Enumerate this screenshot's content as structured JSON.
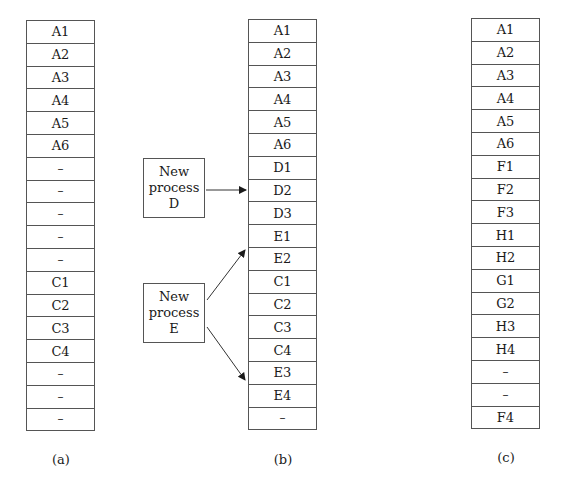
{
  "columns": [
    {
      "caption": "(a)",
      "cells": [
        "A1",
        "A2",
        "A3",
        "A4",
        "A5",
        "A6",
        "–",
        "–",
        "–",
        "–",
        "–",
        "C1",
        "C2",
        "C3",
        "C4",
        "–",
        "–",
        "–"
      ]
    },
    {
      "caption": "(b)",
      "cells": [
        "A1",
        "A2",
        "A3",
        "A4",
        "A5",
        "A6",
        "D1",
        "D2",
        "D3",
        "E1",
        "E2",
        "C1",
        "C2",
        "C3",
        "C4",
        "E3",
        "E4",
        "–"
      ]
    },
    {
      "caption": "(c)",
      "cells": [
        "A1",
        "A2",
        "A3",
        "A4",
        "A5",
        "A6",
        "F1",
        "F2",
        "F3",
        "H1",
        "H2",
        "G1",
        "G2",
        "H3",
        "H4",
        "–",
        "–",
        "F4"
      ]
    }
  ],
  "processes": [
    {
      "line1": "New",
      "line2": "process",
      "line3": "D"
    },
    {
      "line1": "New",
      "line2": "process",
      "line3": "E"
    }
  ],
  "colors": {
    "line": "#555555",
    "text": "#1a1a1a"
  }
}
